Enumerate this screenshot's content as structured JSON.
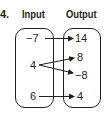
{
  "problem": {
    "number": "4."
  },
  "input": {
    "header": "Input",
    "values": [
      "−7",
      "4",
      "6"
    ]
  },
  "output": {
    "header": "Output",
    "values": [
      "14",
      "8",
      "−8",
      "4"
    ]
  },
  "mappings": [
    {
      "from": "−7",
      "to": "14"
    },
    {
      "from": "4",
      "to": "8"
    },
    {
      "from": "4",
      "to": "−8"
    },
    {
      "from": "6",
      "to": "4"
    }
  ],
  "colors": {
    "ink": "#231f20",
    "background": "#ffffff"
  }
}
